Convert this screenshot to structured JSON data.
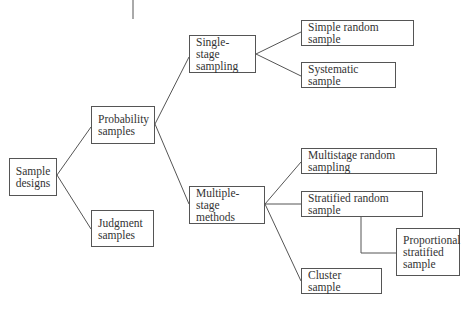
{
  "diagram": {
    "title": "",
    "nodes": {
      "sample_designs": "Sample designs",
      "probability_samples": "Probability samples",
      "judgment_samples": "Judgment samples",
      "single_stage_sampling": "Single-stage sampling",
      "multiple_stage_methods": "Multiple-stage methods",
      "simple_random_sample": "Simple random sample",
      "systematic_sample": "Systematic sample",
      "multistage_random_sampling": "Multistage random sampling",
      "stratified_random_sample": "Stratified random sample",
      "proportional_stratified_sample": "Proportional stratified sample",
      "cluster_sample": "Cluster sample"
    },
    "edges": [
      [
        "sample_designs",
        "probability_samples"
      ],
      [
        "sample_designs",
        "judgment_samples"
      ],
      [
        "probability_samples",
        "single_stage_sampling"
      ],
      [
        "probability_samples",
        "multiple_stage_methods"
      ],
      [
        "single_stage_sampling",
        "simple_random_sample"
      ],
      [
        "single_stage_sampling",
        "systematic_sample"
      ],
      [
        "multiple_stage_methods",
        "multistage_random_sampling"
      ],
      [
        "multiple_stage_methods",
        "stratified_random_sample"
      ],
      [
        "multiple_stage_methods",
        "cluster_sample"
      ],
      [
        "stratified_random_sample",
        "proportional_stratified_sample"
      ]
    ],
    "colors": {
      "line": "#555555",
      "text": "#333333",
      "background": "#ffffff"
    }
  }
}
